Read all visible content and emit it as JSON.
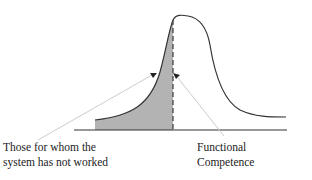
{
  "diagram": {
    "type": "distribution-curve",
    "labels": {
      "left_line1": "Those for whom the",
      "left_line2": "system has not worked",
      "right_line1": "Functional",
      "right_line2": "Competence"
    },
    "colors": {
      "curve": "#333333",
      "shade": "#b3b3b3",
      "baseline": "#333333",
      "pointer": "#cccccc"
    }
  }
}
